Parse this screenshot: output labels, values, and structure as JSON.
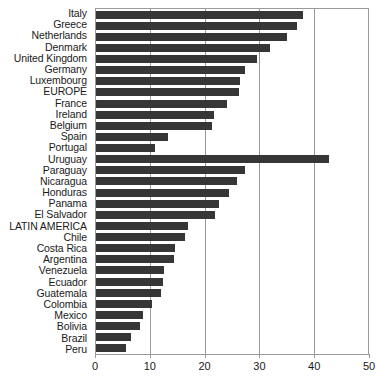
{
  "chart_data": {
    "type": "bar",
    "orientation": "horizontal",
    "title": "",
    "subtitle": "",
    "xlabel": "",
    "ylabel": "",
    "xlim": [
      0,
      50
    ],
    "xticks": [
      0,
      10,
      20,
      30,
      40,
      50
    ],
    "grid": true,
    "gridlines_axis": "x",
    "legend": null,
    "bar_color": "#363636",
    "frame_color": "#9a9a9a",
    "background_color": "#ffffff",
    "categories": [
      "Italy",
      "Greece",
      "Netherlands",
      "Denmark",
      "United Kingdom",
      "Germany",
      "Luxembourg",
      "EUROPE",
      "France",
      "Ireland",
      "Belgium",
      "Spain",
      "Portugal",
      "Uruguay",
      "Paraguay",
      "Nicaragua",
      "Honduras",
      "Panama",
      "El Salvador",
      "LATIN AMERICA",
      "Chile",
      "Costa Rica",
      "Argentina",
      "Venezuela",
      "Ecuador",
      "Guatemala",
      "Colombia",
      "Mexico",
      "Bolivia",
      "Brazil",
      "Peru"
    ],
    "values": [
      38.0,
      37.0,
      35.2,
      32.0,
      29.6,
      27.4,
      26.5,
      26.2,
      24.0,
      21.6,
      21.3,
      13.2,
      10.9,
      42.9,
      27.4,
      26.0,
      24.5,
      22.6,
      21.8,
      17.0,
      16.4,
      14.6,
      14.3,
      12.5,
      12.3,
      12.0,
      10.3,
      8.7,
      8.1,
      6.4,
      5.5
    ]
  }
}
